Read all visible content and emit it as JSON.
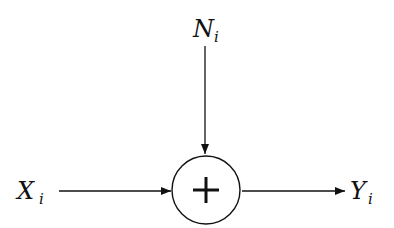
{
  "diagram": {
    "type": "block-diagram",
    "nodes": [
      {
        "id": "input",
        "label": "X",
        "subscript": "i"
      },
      {
        "id": "noise",
        "label": "N",
        "subscript": "i"
      },
      {
        "id": "adder",
        "symbol": "+"
      },
      {
        "id": "output",
        "label": "Y",
        "subscript": "i"
      }
    ],
    "edges": [
      {
        "from": "input",
        "to": "adder"
      },
      {
        "from": "noise",
        "to": "adder"
      },
      {
        "from": "adder",
        "to": "output"
      }
    ]
  },
  "labels": {
    "input": {
      "main": "X",
      "sub": "i"
    },
    "noise": {
      "main": "N",
      "sub": "i"
    },
    "output": {
      "main": "Y",
      "sub": "i"
    },
    "adder_symbol": "+"
  },
  "colors": {
    "stroke": "#111111",
    "background": "#ffffff"
  }
}
